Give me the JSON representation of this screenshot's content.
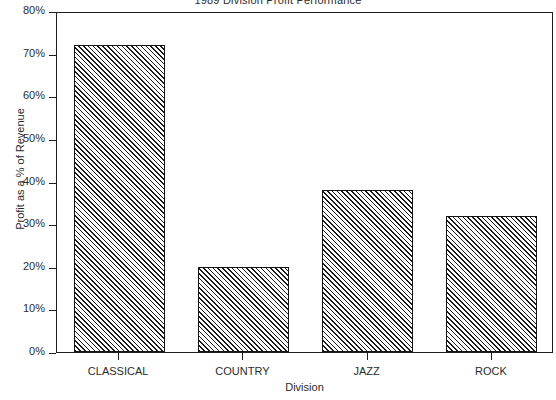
{
  "chart_data": {
    "type": "bar",
    "title": "1989 Division Profit Performance",
    "xlabel": "Division",
    "ylabel": "Profit as a % of Revenue",
    "categories": [
      "CLASSICAL",
      "COUNTRY",
      "JAZZ",
      "ROCK"
    ],
    "values": [
      72,
      20,
      38,
      32
    ],
    "ytick_labels": [
      "80%",
      "70%",
      "60%",
      "50%",
      "40%",
      "30%",
      "20%",
      "10%",
      "0%"
    ],
    "ytick_values": [
      80,
      70,
      60,
      50,
      40,
      30,
      20,
      10,
      0
    ],
    "ylim": [
      0,
      80
    ],
    "grid": false,
    "legend": "none",
    "bar_fill": "diagonal-hatch",
    "bar_edge_color": "#141414",
    "background_color": "#ffffff"
  },
  "axes": {
    "y_label_text": "Profit as a % of Revenue",
    "x_label_text": "Division"
  }
}
